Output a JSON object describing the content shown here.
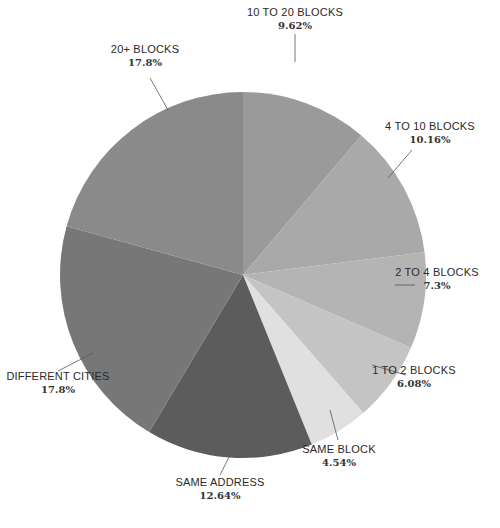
{
  "chart_data": {
    "type": "pie",
    "title": "",
    "start_angle_deg": 0,
    "direction": "clockwise",
    "center": [
      243,
      275
    ],
    "radius": 183,
    "slices": [
      {
        "label": "10 TO 20 BLOCKS",
        "value": 9.62,
        "display": "9.62%",
        "color": "#9a9a9a",
        "label_pos": [
          295,
          16
        ],
        "label_anchor": "middle",
        "leader": [
          [
            295,
            34
          ],
          [
            295,
            62
          ]
        ]
      },
      {
        "label": "4 TO 10 BLOCKS",
        "value": 10.16,
        "display": "10.16%",
        "color": "#a9a9a9",
        "label_pos": [
          430,
          130
        ],
        "label_anchor": "middle",
        "leader": [
          [
            412,
            150
          ],
          [
            388,
            178
          ]
        ]
      },
      {
        "label": "2 TO 4 BLOCKS",
        "value": 7.3,
        "display": "7.3%",
        "color": "#b4b4b4",
        "label_pos": [
          437,
          276
        ],
        "label_anchor": "middle",
        "leader": [
          [
            415,
            285
          ],
          [
            395,
            285
          ]
        ]
      },
      {
        "label": "1 TO 2 BLOCKS",
        "value": 6.08,
        "display": "6.08%",
        "color": "#c4c4c4",
        "label_pos": [
          414,
          374
        ],
        "label_anchor": "middle",
        "leader": [
          [
            406,
            375
          ],
          [
            372,
            365
          ]
        ]
      },
      {
        "label": "SAME BLOCK",
        "value": 4.54,
        "display": "4.54%",
        "color": "#e0e0e0",
        "label_pos": [
          339,
          453
        ],
        "label_anchor": "middle",
        "leader": [
          [
            338,
            440
          ],
          [
            330,
            410
          ]
        ]
      },
      {
        "label": "SAME ADDRESS",
        "value": 12.64,
        "display": "12.64%",
        "color": "#5c5c5c",
        "label_pos": [
          220,
          486
        ],
        "label_anchor": "middle",
        "leader": [
          [
            220,
            475
          ],
          [
            230,
            455
          ]
        ]
      },
      {
        "label": "DIFFERENT CITIES",
        "value": 17.8,
        "display": "17.8%",
        "color": "#777777",
        "label_pos": [
          58,
          380
        ],
        "label_anchor": "middle",
        "leader": [
          [
            58,
            371
          ],
          [
            93,
            353
          ]
        ]
      },
      {
        "label": "20+ BLOCKS",
        "value": 17.8,
        "display": "17.8%",
        "color": "#8a8a8a",
        "label_pos": [
          145,
          53
        ],
        "label_anchor": "middle",
        "leader": [
          [
            150,
            78
          ],
          [
            168,
            110
          ]
        ]
      }
    ],
    "legend": null,
    "background": "#ffffff"
  }
}
